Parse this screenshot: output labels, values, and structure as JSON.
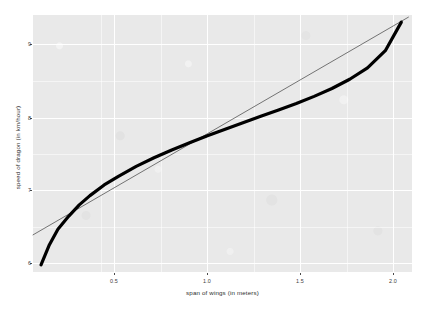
{
  "chart_data": {
    "type": "line",
    "title": "",
    "xlabel": "span of wings (in meters)",
    "ylabel": "speed of dragon (in km/hour)",
    "xlim": [
      0.02,
      2.15
    ],
    "ylim": [
      5.85,
      9.45
    ],
    "xticks": [
      0.5,
      1.0,
      1.5,
      2.0
    ],
    "xtick_labels": [
      "0.5",
      "1.0",
      "1.5",
      "2.0"
    ],
    "yticks": [
      6,
      7,
      8,
      9
    ],
    "ytick_labels": [
      "6",
      "7",
      "8",
      "9"
    ],
    "grid": true,
    "legend": "none",
    "panel_background": "#e9e9e9",
    "gridline_color": "#ffffff",
    "series": [
      {
        "name": "smooth fit (logarithmic)",
        "style": "thick-curve",
        "color": "#000000",
        "linewidth": 3.2,
        "x": [
          0.065,
          0.11,
          0.16,
          0.22,
          0.28,
          0.34,
          0.42,
          0.5,
          0.6,
          0.7,
          0.8,
          0.9,
          1.0,
          1.1,
          1.2,
          1.3,
          1.4,
          1.5,
          1.6,
          1.7,
          1.8,
          1.9,
          2.0,
          2.09
        ],
        "y": [
          5.95,
          6.22,
          6.45,
          6.63,
          6.79,
          6.92,
          7.07,
          7.19,
          7.33,
          7.45,
          7.56,
          7.66,
          7.76,
          7.85,
          7.94,
          8.03,
          8.12,
          8.21,
          8.31,
          8.42,
          8.55,
          8.71,
          8.95,
          9.35
        ]
      },
      {
        "name": "linear trend",
        "style": "thin-line",
        "color": "#3f3f3f",
        "linewidth": 0.7,
        "x": [
          0.02,
          2.13
        ],
        "y": [
          6.37,
          9.42
        ]
      }
    ],
    "annotations": []
  },
  "axis": {
    "x_title": "span of wings (in meters)",
    "y_title": "speed of dragon (in km/hour)"
  }
}
